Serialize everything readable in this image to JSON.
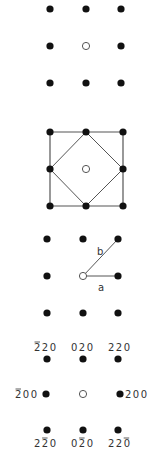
{
  "colors": {
    "dot": "#111111",
    "line": "#555555",
    "open_circle_stroke": "#555555",
    "label": "#333333",
    "background": "#ffffff"
  },
  "panels": [
    {
      "id": "panel-1-lattice",
      "description": "3x3 grid of spots with open circle at center",
      "spots": [
        {
          "x": 50,
          "y": 9,
          "filled": true
        },
        {
          "x": 86,
          "y": 9,
          "filled": true
        },
        {
          "x": 121,
          "y": 9,
          "filled": true
        },
        {
          "x": 50,
          "y": 46,
          "filled": true
        },
        {
          "x": 86,
          "y": 46,
          "filled": false
        },
        {
          "x": 121,
          "y": 46,
          "filled": true
        },
        {
          "x": 50,
          "y": 83,
          "filled": true
        },
        {
          "x": 86,
          "y": 83,
          "filled": true
        },
        {
          "x": 121,
          "y": 83,
          "filled": true
        }
      ]
    },
    {
      "id": "panel-2-cells",
      "description": "Square cell with inscribed diamond (primitive cell)",
      "spots": [
        {
          "x": 50,
          "y": 132,
          "filled": true
        },
        {
          "x": 86,
          "y": 132,
          "filled": true
        },
        {
          "x": 123,
          "y": 132,
          "filled": true
        },
        {
          "x": 50,
          "y": 169,
          "filled": true
        },
        {
          "x": 86,
          "y": 169,
          "filled": false
        },
        {
          "x": 123,
          "y": 169,
          "filled": true
        },
        {
          "x": 50,
          "y": 206,
          "filled": true
        },
        {
          "x": 86,
          "y": 206,
          "filled": true
        },
        {
          "x": 123,
          "y": 206,
          "filled": true
        }
      ],
      "square": [
        [
          50,
          132
        ],
        [
          123,
          132
        ],
        [
          123,
          206
        ],
        [
          50,
          206
        ]
      ],
      "diamond": [
        [
          86,
          132
        ],
        [
          123,
          169
        ],
        [
          86,
          206
        ],
        [
          50,
          169
        ]
      ]
    },
    {
      "id": "panel-3-vectors",
      "description": "Basis vectors a and b from origin",
      "spots": [
        {
          "x": 47,
          "y": 239,
          "filled": true
        },
        {
          "x": 83,
          "y": 239,
          "filled": true
        },
        {
          "x": 118,
          "y": 239,
          "filled": true
        },
        {
          "x": 47,
          "y": 276,
          "filled": true
        },
        {
          "x": 83,
          "y": 276,
          "filled": false
        },
        {
          "x": 118,
          "y": 276,
          "filled": true
        }
      ],
      "vectors": [
        {
          "label": "a",
          "from": [
            83,
            276
          ],
          "to": [
            118,
            276
          ],
          "label_pos": [
            98,
            291
          ]
        },
        {
          "label": "b",
          "from": [
            83,
            276
          ],
          "to": [
            118,
            239
          ],
          "label_pos": [
            97,
            255
          ]
        }
      ]
    },
    {
      "id": "panel-4-indexed",
      "description": "Indexed diffraction spots",
      "spots": [
        {
          "x": 47,
          "y": 313,
          "filled": true
        },
        {
          "x": 83,
          "y": 313,
          "filled": true
        },
        {
          "x": 118,
          "y": 313,
          "filled": true
        },
        {
          "x": 47,
          "y": 359,
          "filled": true
        },
        {
          "x": 83,
          "y": 359,
          "filled": true
        },
        {
          "x": 118,
          "y": 359,
          "filled": true
        },
        {
          "x": 46,
          "y": 394,
          "filled": true
        },
        {
          "x": 83,
          "y": 394,
          "filled": false
        },
        {
          "x": 120,
          "y": 394,
          "filled": true
        },
        {
          "x": 47,
          "y": 430,
          "filled": true
        },
        {
          "x": 83,
          "y": 430,
          "filled": true
        },
        {
          "x": 118,
          "y": 430,
          "filled": true
        }
      ],
      "labels": [
        {
          "text": "220",
          "bar_index": 0,
          "x": 34,
          "y": 351
        },
        {
          "text": "020",
          "bar_index": null,
          "x": 71,
          "y": 351
        },
        {
          "text": "220",
          "bar_index": null,
          "x": 108,
          "y": 351
        },
        {
          "text": "200",
          "bar_index": 0,
          "x": 15,
          "y": 398
        },
        {
          "text": "200",
          "bar_index": null,
          "x": 125,
          "y": 398
        },
        {
          "text": "220",
          "bar_index": 1,
          "x": 34,
          "y": 447
        },
        {
          "text": "020",
          "bar_index": 1,
          "x": 71,
          "y": 447
        },
        {
          "text": "220",
          "bar_index": 2,
          "x": 108,
          "y": 447
        }
      ],
      "label_strings": [
        "̄220 (-2 2 0)",
        "020",
        "220",
        "-2 0 0",
        "200",
        "2 -2 0",
        "0 -2 0",
        "2 2 -0"
      ]
    }
  ]
}
